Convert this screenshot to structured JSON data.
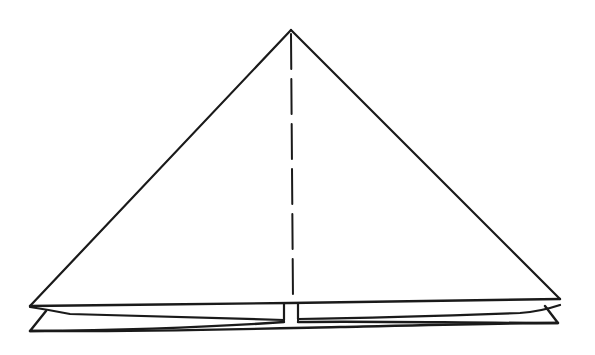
{
  "diagram": {
    "type": "origami-fold-illustration",
    "colors": {
      "background": "#ffffff",
      "ink": "#1a1a1a"
    },
    "shapes": {
      "apex": [
        291,
        30
      ],
      "left_corner": [
        30,
        306
      ],
      "right_corner": [
        560,
        299
      ],
      "fold_line": {
        "style": "dashed",
        "x": 292,
        "y_start": 34,
        "y_end": 300,
        "dash_length": 35,
        "gap_length": 10
      },
      "bottom_layers": 3
    }
  }
}
